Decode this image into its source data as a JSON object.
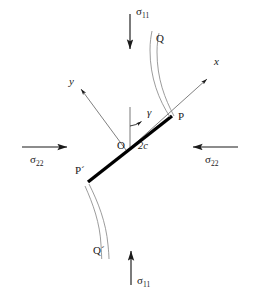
{
  "figure": {
    "type": "mechanics-diagram",
    "background_color": "#ffffff",
    "ink_color": "#1a1a1a",
    "crack_color": "#000000"
  },
  "labels": {
    "sigma11_top": "σ",
    "sigma11_top_sub": "11",
    "sigma11_bottom": "σ",
    "sigma11_bottom_sub": "11",
    "sigma22_left": "σ",
    "sigma22_left_sub": "22",
    "sigma22_right": "σ",
    "sigma22_right_sub": "22",
    "axis_x": "x",
    "axis_y": "y",
    "origin": "O",
    "crack_length": "2c",
    "angle": "γ",
    "tip_p": "P",
    "tip_p_prime": "P´",
    "wing_q": "Q",
    "wing_q_prime": "Q´"
  },
  "geometry": {
    "main_crack": {
      "start": [
        88,
        182
      ],
      "end": [
        172,
        116
      ]
    },
    "origin_point": [
      127,
      151
    ],
    "x_axis_arrow": {
      "from": [
        127,
        151
      ],
      "to": [
        208,
        78
      ]
    },
    "y_axis_arrow": {
      "from": [
        127,
        151
      ],
      "to": [
        80,
        88
      ]
    },
    "vertical_reference": {
      "from": [
        130,
        108
      ],
      "to": [
        130,
        146
      ]
    },
    "angle_value_label": "γ",
    "arrows": {
      "top": {
        "from": [
          130,
          14
        ],
        "to": [
          130,
          50
        ],
        "direction": "down"
      },
      "bottom": {
        "from": [
          131,
          285
        ],
        "to": [
          131,
          250
        ],
        "direction": "up"
      },
      "left": {
        "from": [
          22,
          147
        ],
        "to": [
          68,
          147
        ],
        "direction": "right"
      },
      "right": {
        "from": [
          238,
          147
        ],
        "to": [
          192,
          147
        ],
        "direction": "left"
      }
    }
  }
}
